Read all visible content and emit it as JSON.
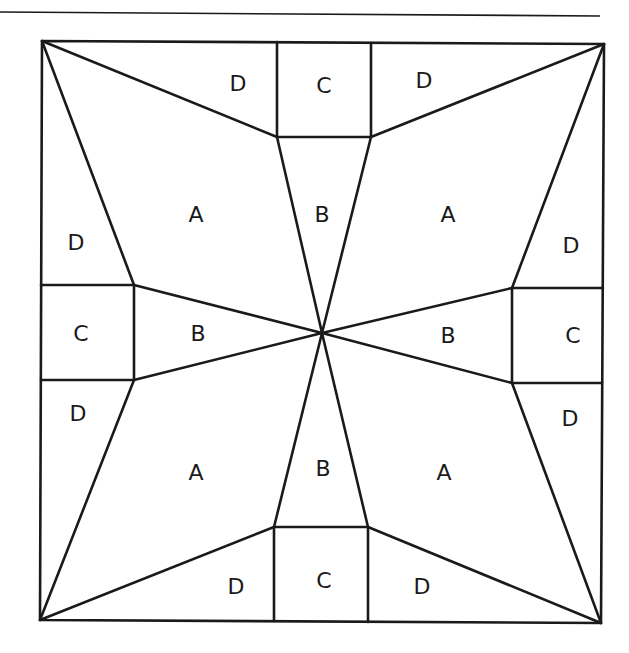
{
  "diagram": {
    "type": "quilt-block-pattern",
    "line_color": "#1a1a1a",
    "background": "#ffffff",
    "labels": {
      "top_d_left": "D",
      "top_c": "C",
      "top_d_right": "D",
      "upper_a_left": "A",
      "upper_b": "B",
      "upper_a_right": "A",
      "left_d_upper": "D",
      "right_d_upper": "D",
      "left_c": "C",
      "left_b": "B",
      "right_b": "B",
      "right_c": "C",
      "left_d_lower": "D",
      "right_d_lower": "D",
      "lower_a_left": "A",
      "lower_b": "B",
      "lower_a_right": "A",
      "bottom_d_left": "D",
      "bottom_c": "C",
      "bottom_d_right": "D"
    },
    "piece_counts": {
      "A": 4,
      "B": 4,
      "C": 4,
      "D": 8
    }
  }
}
